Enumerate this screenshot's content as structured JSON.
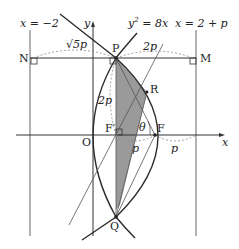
{
  "diagram": {
    "labels": {
      "directrix": "x = −2",
      "right_line": "x = 2 + p",
      "parabola": "y",
      "parabola_eq_sup": "2",
      "parabola_eq_rest": " = 8x",
      "y_axis": "y",
      "x_axis": "x",
      "origin": "O",
      "N": "N",
      "M": "M",
      "P": "P",
      "R": "R",
      "Q": "Q",
      "F": "F",
      "F_prime": "F′",
      "theta": "θ",
      "NP_len": "√5p",
      "PM_len": "2p",
      "PF_len": "2p",
      "FpF_len": "p",
      "F_right_len": "p"
    },
    "colors": {
      "line": "#2b2b2b",
      "thin_line": "#555555",
      "dashed": "#888888",
      "shade": "#9a9a9a"
    }
  }
}
